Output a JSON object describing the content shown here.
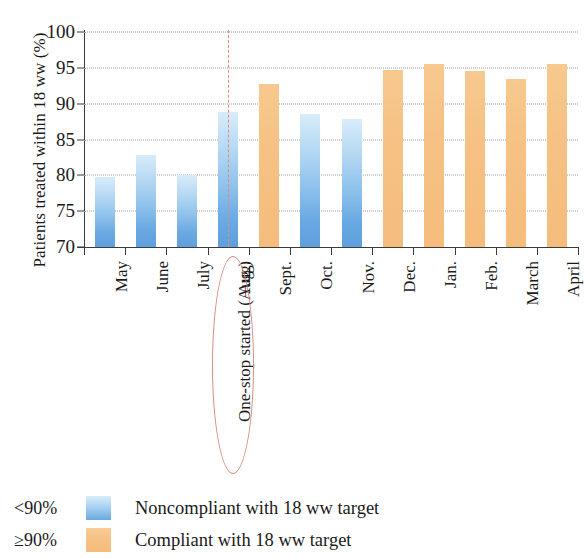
{
  "chart_data": {
    "type": "bar",
    "title": "",
    "xlabel": "",
    "ylabel": "Patients treated within 18 ww (%)",
    "ylim": [
      70,
      100
    ],
    "yticks": [
      70,
      75,
      80,
      85,
      90,
      95,
      100
    ],
    "grid": true,
    "categories": [
      "May",
      "June",
      "July",
      "Aug.",
      "Sept.",
      "Oct.",
      "Nov.",
      "Dec.",
      "Jan.",
      "Feb.",
      "March",
      "April"
    ],
    "values": [
      79.7,
      82.8,
      80.1,
      88.8,
      92.7,
      88.6,
      87.8,
      94.7,
      95.5,
      94.6,
      93.5,
      95.5
    ],
    "compliance": [
      "low",
      "low",
      "low",
      "low",
      "high",
      "low",
      "low",
      "high",
      "high",
      "high",
      "high",
      "high"
    ],
    "threshold": 90,
    "annotation": {
      "text": "One-stop started (Aug.)",
      "at_category": "Aug.",
      "line_style": "dashed",
      "line_color": "#e08b7c",
      "ellipse_color": "#d98c7d"
    },
    "legend": {
      "position": "below-plot",
      "entries": [
        {
          "threshold": "<90%",
          "color": "#8fc2ec",
          "label": "Noncompliant with 18 ww target"
        },
        {
          "threshold": "≥90%",
          "color": "#f5bd7c",
          "label": "Compliant with 18 ww target"
        }
      ]
    },
    "colors": {
      "low": "#8fc2ec",
      "high": "#f5bd7c",
      "axis": "#3a3a38",
      "grid": "#9b9b9b"
    }
  }
}
